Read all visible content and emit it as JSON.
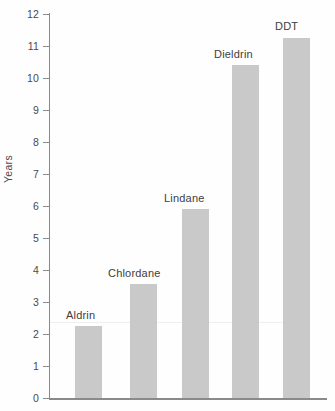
{
  "chart_data": {
    "type": "bar",
    "title": "",
    "subtitle": "",
    "xlabel": "",
    "ylabel": "Years",
    "categories": [
      "Aldrin",
      "Chlordane",
      "Lindane",
      "Dieldrin",
      "DDT"
    ],
    "values": [
      2.25,
      3.55,
      5.9,
      10.4,
      11.25
    ],
    "ylim": [
      0,
      12
    ],
    "ytick_step": 1,
    "ytick_labels": [
      "12",
      "11",
      "10",
      "9",
      "8",
      "7",
      "6",
      "5",
      "4",
      "3",
      "2",
      "1",
      "0"
    ],
    "xtick_labels": [],
    "grid": false,
    "legend": false,
    "legend_position": "none",
    "annotations": [
      {
        "text": "Aldrin",
        "attached_to": "Aldrin",
        "position": "above-bar"
      },
      {
        "text": "Chlordane",
        "attached_to": "Chlordane",
        "position": "above-bar"
      },
      {
        "text": "Lindane",
        "attached_to": "Lindane",
        "position": "above-bar"
      },
      {
        "text": "Dieldrin",
        "attached_to": "Dieldrin",
        "position": "above-bar"
      },
      {
        "text": "DDT",
        "attached_to": "DDT",
        "position": "above-bar"
      }
    ],
    "colors": {
      "bar_fill": "#c9c9c9",
      "axis": "#8a8a8a",
      "tick_text": "#4a4a4a",
      "label_text": "#3d3d3d",
      "background": "#fefefe"
    }
  },
  "bars": [
    {
      "label": "Aldrin",
      "value": 2.25,
      "x": 75,
      "width": 27,
      "label_x": 66,
      "label_y": 310
    },
    {
      "label": "Chlordane",
      "value": 3.55,
      "x": 130,
      "width": 27,
      "label_x": 108,
      "label_y": 268
    },
    {
      "label": "Lindane",
      "value": 5.9,
      "x": 182,
      "width": 27,
      "label_x": 164,
      "label_y": 193
    },
    {
      "label": "Dieldrin",
      "value": 10.4,
      "x": 232,
      "width": 27,
      "label_x": 214,
      "label_y": 49
    },
    {
      "label": "DDT",
      "value": 11.25,
      "x": 283,
      "width": 27,
      "label_x": 275,
      "label_y": 21
    }
  ],
  "yticks": [
    {
      "label": "12",
      "value": 12
    },
    {
      "label": "11",
      "value": 11
    },
    {
      "label": "10",
      "value": 10
    },
    {
      "label": "9",
      "value": 9
    },
    {
      "label": "8",
      "value": 8
    },
    {
      "label": "7",
      "value": 7
    },
    {
      "label": "6",
      "value": 6
    },
    {
      "label": "5",
      "value": 5
    },
    {
      "label": "4",
      "value": 4
    },
    {
      "label": "3",
      "value": 3
    },
    {
      "label": "2",
      "value": 2
    },
    {
      "label": "1",
      "value": 1
    },
    {
      "label": "0",
      "value": 0
    }
  ]
}
